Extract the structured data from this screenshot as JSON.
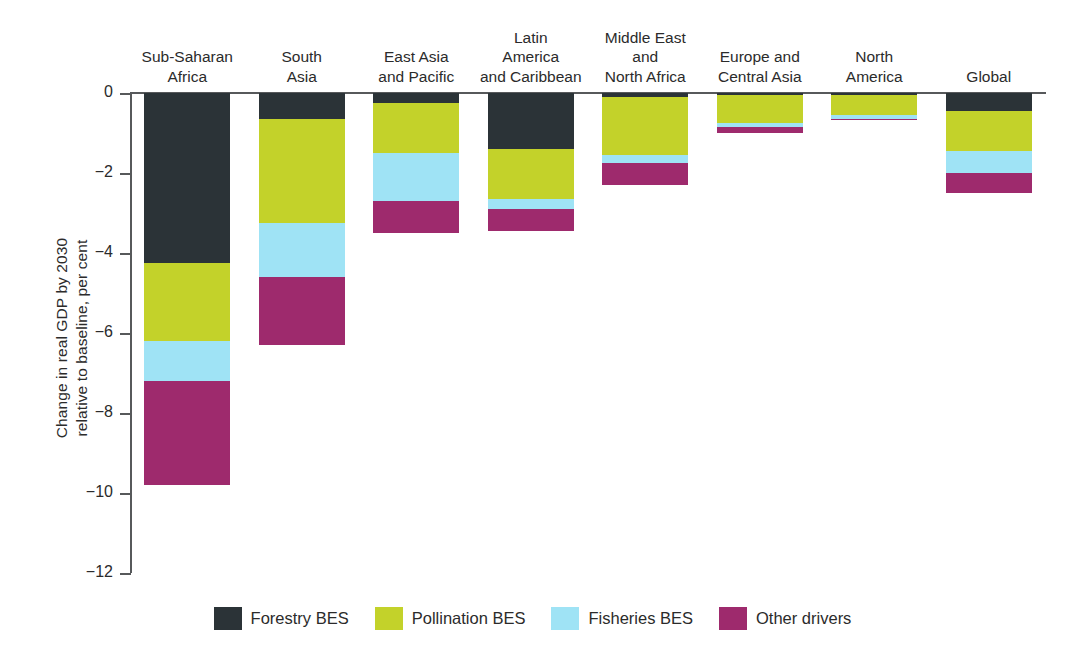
{
  "axis": {
    "y_title": "Change in real GDP by 2030\nrelative to baseline, per cent",
    "ticks": [
      "0",
      "−2",
      "−4",
      "−6",
      "−8",
      "−10",
      "−12"
    ]
  },
  "legend": {
    "items": [
      {
        "label": "Forestry BES",
        "color": "#2b3337"
      },
      {
        "label": "Pollination BES",
        "color": "#c3d22a"
      },
      {
        "label": "Fisheries BES",
        "color": "#9fe3f5"
      },
      {
        "label": "Other drivers",
        "color": "#9e2a6d"
      }
    ]
  },
  "categories": [
    "Sub-Saharan\nAfrica",
    "South\nAsia",
    "East Asia\nand Pacific",
    "Latin\nAmerica\nand Caribbean",
    "Middle East\nand\nNorth Africa",
    "Europe and\nCentral Asia",
    "North\nAmerica",
    "Global"
  ],
  "chart_data": {
    "type": "bar",
    "stacked": true,
    "title": "",
    "xlabel": "",
    "ylabel": "Change in real GDP by 2030 relative to baseline, per cent",
    "ylim": [
      -12,
      0
    ],
    "ytick_values": [
      0,
      -2,
      -4,
      -6,
      -8,
      -10,
      -12
    ],
    "grid": false,
    "legend_position": "bottom",
    "categories": [
      "Sub-Saharan Africa",
      "South Asia",
      "East Asia and Pacific",
      "Latin America and Caribbean",
      "Middle East and North Africa",
      "Europe and Central Asia",
      "North America",
      "Global"
    ],
    "series": [
      {
        "name": "Forestry BES",
        "color": "#2b3337",
        "values": [
          -4.25,
          -0.65,
          -0.25,
          -1.4,
          -0.1,
          -0.05,
          -0.05,
          -0.45
        ]
      },
      {
        "name": "Pollination BES",
        "color": "#c3d22a",
        "values": [
          -1.95,
          -2.6,
          -1.25,
          -1.25,
          -1.45,
          -0.7,
          -0.5,
          -1.0
        ]
      },
      {
        "name": "Fisheries BES",
        "color": "#9fe3f5",
        "values": [
          -1.0,
          -1.35,
          -1.2,
          -0.25,
          -0.2,
          -0.1,
          -0.1,
          -0.55
        ]
      },
      {
        "name": "Other drivers",
        "color": "#9e2a6d",
        "values": [
          -2.6,
          -1.7,
          -0.8,
          -0.55,
          -0.55,
          -0.15,
          -0.02,
          -0.5
        ]
      }
    ],
    "totals": [
      -9.8,
      -6.3,
      -3.5,
      -3.45,
      -2.3,
      -1.0,
      -0.67,
      -2.5
    ]
  }
}
